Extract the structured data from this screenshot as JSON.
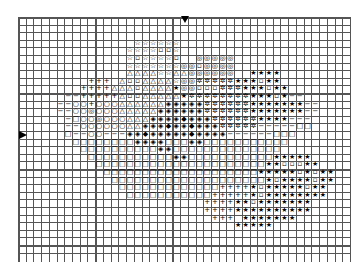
{
  "pattern": {
    "columns": 43,
    "rows": 31,
    "cell_width": 7.72,
    "cell_height": 7.6,
    "grid_color": "#555555",
    "symbol_color": "#000000",
    "center_markers": {
      "top_column": 21.5,
      "left_row": 15.3
    },
    "legend": {
      "S": "★",
      "s": "☆",
      "T": "△",
      "O": "○",
      "@": "◎",
      "Q": "□",
      "D": "◈",
      "d": "▫",
      "x": "✲",
      "+": "+",
      "-": "−",
      "*": "◆",
      ".": ""
    },
    "grid": [
      "...........................................",
      "...........................................",
      "...........................................",
      "...............ssssss......................",
      "..............ssssdds......................",
      "..............sdssssd..@@@@@...............",
      "..............sssssss@@d@@@@...............",
      "..............TTTTssTT@@@@@@..SSSS.........",
      ".........+++.TddTTTTs@@xxxxxSSSdSS.........",
      "........++++TTTdTTTTS@@dddxxxSSSdSS.......",
      "......--+++++TddTTTTTSxxxxxxxxSSSdS--......",
      ".....--OO+OOOTTTTTTDDDDDxxxxxxSSSSSSS--....",
      ".....--OO@OOOTTTTTDDDDDDxxxxxxSSSSSSS--....",
      "......-QOO@OOOTTTDDDD*DDDxxxxxxSSSS---.....",
      "......--OOOOOOTTDDD*DD*DDDxxxxx-----QQ.....",
      "......Q--OO---DD*DDDDD*DDDD------QQQ.......",
      ".......QQQQQQQQDDDDQQQDDQQQQQQQQQQQ........",
      "........QQQQQQQQQQDDQQQQQQQQQQQQQQ.........",
      ".........QQQQQQQQQQQDDQQQQQQQQQQQSSSSS.....",
      "..........QQQQQQQQQQQQQQQQQQQQQQSSdddSS....",
      "...........QQQQQQQQQQQQQQQQQQQQSSSSSdSdSS..",
      "............QQQQQQQQQQQQQQQQQQQQSdSSSSdSS..",
      ".............QQQQQQQQQQQQQ++++SdSSSSSdSS...",
      "..............QQQQQQQQQQQ+++++SdSSSSSSSS...",
      "........................++++SSdSSSSSSS....",
      "........................++++SSSSSSSSSS....",
      ".........................+++.SSSSSSS......",
      "............................SSSSS.........",
      "...........................................",
      "...........................................",
      "..........................................."
    ]
  }
}
